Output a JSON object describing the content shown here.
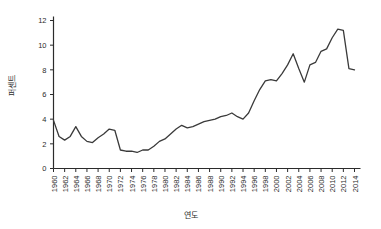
{
  "chart_data": {
    "type": "line",
    "title": "",
    "subtitle": "",
    "xlabel": "연도",
    "ylabel": "퍼센트",
    "xlim": [
      1960,
      2014
    ],
    "ylim": [
      0,
      12
    ],
    "yticks": [
      0,
      2,
      4,
      6,
      8,
      10,
      12
    ],
    "xticks": [
      1960,
      1962,
      1964,
      1966,
      1968,
      1970,
      1972,
      1974,
      1976,
      1978,
      1980,
      1982,
      1984,
      1986,
      1988,
      1990,
      1992,
      1994,
      1996,
      1998,
      2000,
      2002,
      2004,
      2006,
      2008,
      2010,
      2012,
      2014
    ],
    "xtick_labels": [
      "1960",
      "1962",
      "1964",
      "1966",
      "1968",
      "1970",
      "1972",
      "1974",
      "1976",
      "1978",
      "1980",
      "1982",
      "1984",
      "1986",
      "1988",
      "1990",
      "1992",
      "1994",
      "1996",
      "1998",
      "2000",
      "2002",
      "2004",
      "2006",
      "2008",
      "2010",
      "2012",
      "2014"
    ],
    "ytick_labels": [
      "0",
      "2",
      "4",
      "6",
      "8",
      "10",
      "12"
    ],
    "grid": false,
    "legend": false,
    "legend_position": "none",
    "line_color": "#3a3a3a",
    "line_width": 1.3,
    "x": [
      1960,
      1961,
      1962,
      1963,
      1964,
      1965,
      1966,
      1967,
      1968,
      1969,
      1970,
      1971,
      1972,
      1973,
      1974,
      1975,
      1976,
      1977,
      1978,
      1979,
      1980,
      1981,
      1982,
      1983,
      1984,
      1985,
      1986,
      1987,
      1988,
      1989,
      1990,
      1991,
      1992,
      1993,
      1994,
      1995,
      1996,
      1997,
      1998,
      1999,
      2000,
      2001,
      2002,
      2003,
      2004,
      2005,
      2006,
      2007,
      2008,
      2009,
      2010,
      2011,
      2012,
      2013,
      2014
    ],
    "y": [
      3.9,
      2.6,
      2.3,
      2.6,
      3.4,
      2.6,
      2.2,
      2.1,
      2.5,
      2.8,
      3.2,
      3.1,
      1.5,
      1.4,
      1.4,
      1.3,
      1.5,
      1.5,
      1.8,
      2.2,
      2.4,
      2.8,
      3.2,
      3.5,
      3.3,
      3.4,
      3.6,
      3.8,
      3.9,
      4.0,
      4.2,
      4.3,
      4.5,
      4.2,
      4.0,
      4.5,
      5.5,
      6.4,
      7.1,
      7.2,
      7.1,
      7.7,
      8.4,
      9.3,
      8.1,
      7.0,
      8.4,
      8.6,
      9.5,
      9.7,
      10.6,
      11.3,
      11.2,
      8.1,
      8.0
    ],
    "series": [
      {
        "name": "",
        "values": [
          3.9,
          2.6,
          2.3,
          2.6,
          3.4,
          2.6,
          2.2,
          2.1,
          2.5,
          2.8,
          3.2,
          3.1,
          1.5,
          1.4,
          1.4,
          1.3,
          1.5,
          1.5,
          1.8,
          2.2,
          2.4,
          2.8,
          3.2,
          3.5,
          3.3,
          3.4,
          3.6,
          3.8,
          3.9,
          4.0,
          4.2,
          4.3,
          4.5,
          4.2,
          4.0,
          4.5,
          5.5,
          6.4,
          7.1,
          7.2,
          7.1,
          7.7,
          8.4,
          9.3,
          8.1,
          7.0,
          8.4,
          8.6,
          9.5,
          9.7,
          10.6,
          11.3,
          11.2,
          8.1,
          8.0
        ]
      }
    ],
    "annotations": []
  },
  "axis": {
    "ylabel_text": "퍼센트",
    "xlabel_text": "연도"
  }
}
